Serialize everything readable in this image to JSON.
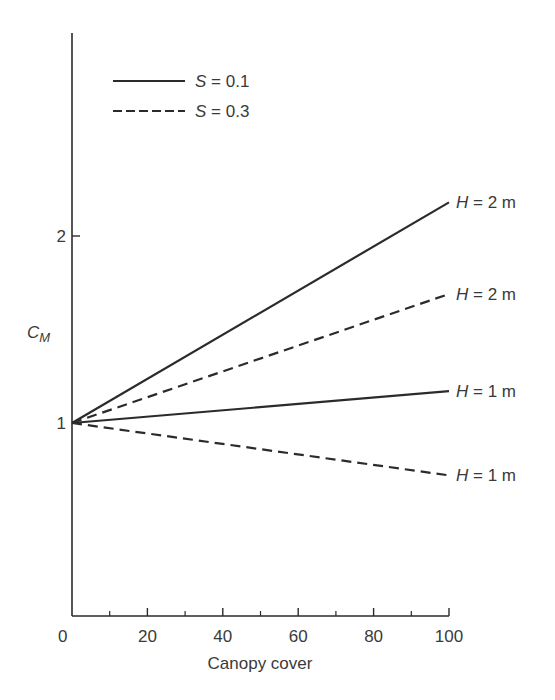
{
  "chart_data": {
    "type": "line",
    "title": "",
    "xlabel": "Canopy cover",
    "ylabel": "C_M",
    "ylabel_main": "C",
    "ylabel_sub": "M",
    "xlim": [
      0,
      100
    ],
    "ylim": [
      0,
      3.1
    ],
    "x_ticks": [
      0,
      20,
      40,
      60,
      80,
      100
    ],
    "x_minor_ticks": [
      10,
      30,
      50,
      70,
      90
    ],
    "y_ticks": [
      1,
      2
    ],
    "grid": false,
    "legend_position": "upper left",
    "legend": [
      {
        "label_var": "S",
        "label_rest": " = 0.1",
        "style": "solid"
      },
      {
        "label_var": "S",
        "label_rest": " = 0.3",
        "style": "dashed"
      }
    ],
    "x": [
      0,
      100
    ],
    "series": [
      {
        "name": "S = 0.1, H = 2 m",
        "style": "solid",
        "values": [
          1.0,
          2.18
        ],
        "end_label_var": "H",
        "end_label_rest": " = 2 m"
      },
      {
        "name": "S = 0.3, H = 2 m",
        "style": "dashed",
        "values": [
          1.0,
          1.69
        ],
        "end_label_var": "H",
        "end_label_rest": " = 2 m"
      },
      {
        "name": "S = 0.1, H = 1 m",
        "style": "solid",
        "values": [
          1.0,
          1.17
        ],
        "end_label_var": "H",
        "end_label_rest": " = 1 m"
      },
      {
        "name": "S = 0.3, H = 1 m",
        "style": "dashed",
        "values": [
          1.0,
          0.72
        ],
        "end_label_var": "H",
        "end_label_rest": " = 1 m"
      }
    ]
  }
}
